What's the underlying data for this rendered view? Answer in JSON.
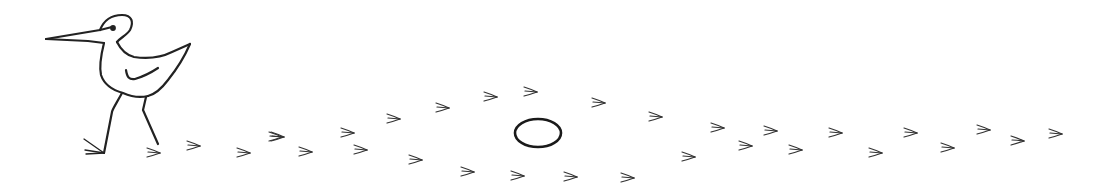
{
  "illustration": {
    "subject": "bird-with-footprint-tracks",
    "ink_color": "#222222",
    "background_color": "#ffffff",
    "bird": {
      "x": 45,
      "y": 15
    },
    "circle": {
      "cx": 538,
      "cy": 133,
      "rx": 23,
      "ry": 14
    },
    "footprints": [
      {
        "x": 148,
        "y": 153
      },
      {
        "x": 188,
        "y": 146
      },
      {
        "x": 238,
        "y": 153
      },
      {
        "x": 272,
        "y": 137
      },
      {
        "x": 300,
        "y": 152
      },
      {
        "x": 270,
        "y": 137
      },
      {
        "x": 342,
        "y": 133
      },
      {
        "x": 388,
        "y": 119
      },
      {
        "x": 437,
        "y": 108
      },
      {
        "x": 485,
        "y": 97
      },
      {
        "x": 525,
        "y": 92
      },
      {
        "x": 593,
        "y": 103
      },
      {
        "x": 650,
        "y": 117
      },
      {
        "x": 712,
        "y": 128
      },
      {
        "x": 765,
        "y": 131
      },
      {
        "x": 830,
        "y": 133
      },
      {
        "x": 905,
        "y": 133
      },
      {
        "x": 978,
        "y": 130
      },
      {
        "x": 1050,
        "y": 134
      },
      {
        "x": 355,
        "y": 150
      },
      {
        "x": 410,
        "y": 160
      },
      {
        "x": 462,
        "y": 172
      },
      {
        "x": 512,
        "y": 176
      },
      {
        "x": 565,
        "y": 177
      },
      {
        "x": 622,
        "y": 178
      },
      {
        "x": 683,
        "y": 157
      },
      {
        "x": 740,
        "y": 146
      },
      {
        "x": 790,
        "y": 150
      },
      {
        "x": 870,
        "y": 153
      },
      {
        "x": 942,
        "y": 148
      },
      {
        "x": 1012,
        "y": 141
      }
    ]
  }
}
